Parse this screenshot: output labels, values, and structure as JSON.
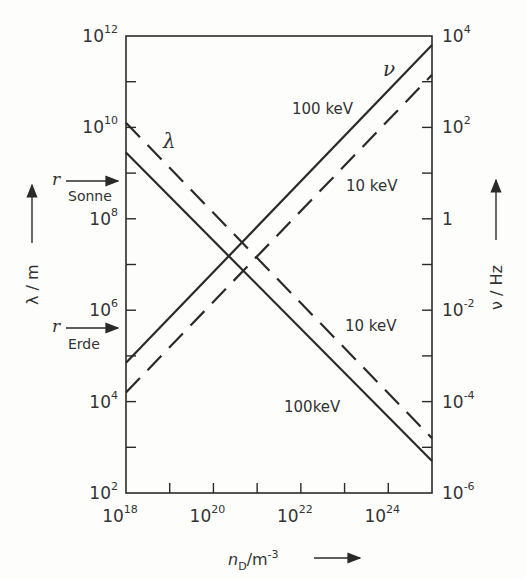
{
  "chart_data": {
    "type": "line",
    "title": "",
    "xscale": "log",
    "yscale": "log",
    "xlabel": "n_D / m^-3",
    "ylabel_left": "λ / m",
    "ylabel_right": "ν / Hz",
    "xlim": [
      1e+18,
      1e+25
    ],
    "ylim_left": [
      100.0,
      1000000000000.0
    ],
    "ylim_right": [
      1e-06,
      10000.0
    ],
    "x_ticks": [
      "10^18",
      "10^20",
      "10^22",
      "10^24"
    ],
    "x_tick_values": [
      18,
      20,
      22,
      24
    ],
    "y_left_ticks": [
      "10^2",
      "10^4",
      "10^6",
      "10^8",
      "10^10",
      "10^12"
    ],
    "y_left_tick_values": [
      2,
      4,
      6,
      8,
      10,
      12
    ],
    "y_right_ticks": [
      "10^-6",
      "10^-4",
      "10^-2",
      "1",
      "10^2",
      "10^4"
    ],
    "y_right_tick_values": [
      -6,
      -4,
      -2,
      0,
      2,
      4
    ],
    "grid": false,
    "series": [
      {
        "name": "λ 100keV",
        "quantity": "λ",
        "energy": "100keV",
        "axis": "left",
        "style": "solid",
        "log10_x": [
          18,
          25
        ],
        "log10_y": [
          9.45,
          2.7
        ]
      },
      {
        "name": "λ 10keV",
        "quantity": "λ",
        "energy": "10keV",
        "axis": "left",
        "style": "dashed",
        "log10_x": [
          18,
          25
        ],
        "log10_y": [
          10.1,
          3.2
        ]
      },
      {
        "name": "ν 100keV",
        "quantity": "ν",
        "energy": "100keV",
        "axis": "right",
        "style": "solid",
        "log10_x": [
          18,
          25
        ],
        "log10_y": [
          -3.15,
          3.8
        ]
      },
      {
        "name": "ν 10keV",
        "quantity": "ν",
        "energy": "10keV",
        "axis": "right",
        "style": "dashed",
        "log10_x": [
          18,
          25
        ],
        "log10_y": [
          -3.8,
          3.15
        ]
      }
    ],
    "annotations": [
      {
        "text": "λ",
        "log10_x": 19.2,
        "log10_y": 9.6
      },
      {
        "text": "ν",
        "log10_x": 23.8,
        "log10_y": 3.2
      },
      {
        "text": "100keV",
        "near": "ν 100keV"
      },
      {
        "text": "10keV",
        "near": "ν 10keV"
      },
      {
        "text": "10keV",
        "near": "λ 10keV"
      },
      {
        "text": "100keV",
        "near": "λ 100keV"
      },
      {
        "text": "r Sonne",
        "axis": "left",
        "log10_y": 8.83
      },
      {
        "text": "r Erde",
        "axis": "left",
        "log10_y": 5.62
      }
    ]
  },
  "labels": {
    "y_left_title": "λ / m",
    "y_right_title": "ν / Hz",
    "x_title_base": "n",
    "x_title_sub": "D",
    "x_title_unit": "/m",
    "x_title_exp": "-3",
    "lambda_symbol": "λ",
    "nu_symbol": "ν",
    "label_nu_100": "100 keV",
    "label_nu_10": "10 keV",
    "label_lambda_10": "10 keV",
    "label_lambda_100": "100keV",
    "sonne_r": "r",
    "sonne": "Sonne",
    "erde_r": "r",
    "erde": "Erde"
  }
}
